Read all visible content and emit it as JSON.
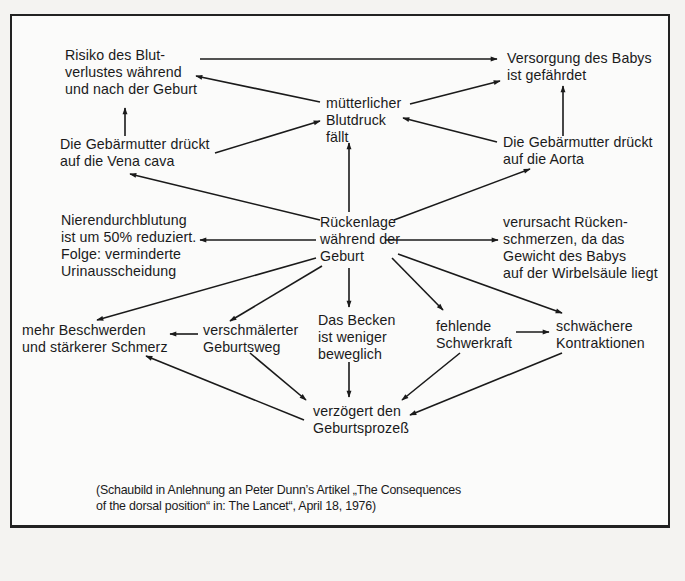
{
  "diagram": {
    "language": "de",
    "nodes": {
      "blutverlust": "Risiko des Blut-\nverlustes während\nund nach der Geburt",
      "versorgung": "Versorgung des Babys\nist gefährdet",
      "blutdruck": "mütterlicher\nBlutdruck\nfällt",
      "vena_cava": "Die Gebärmutter drückt\nauf die Vena cava",
      "aorta": "Die Gebärmutter drückt\nauf die Aorta",
      "niere": "Nierendurchblutung\nist um 50% reduziert.\nFolge: verminderte\nUrinausscheidung",
      "rueckenlage": "Rückenlage\nwährend der\nGeburt",
      "rueckenschmerz": "verursacht Rücken-\nschmerzen, da das\nGewicht des Babys\nauf der Wirbelsäule liegt",
      "beschwerden": "mehr Beschwerden\nund stärkerer Schmerz",
      "geburtsweg": "verschmälerter\nGeburtsweg",
      "becken": "Das Becken\nist weniger\nbeweglich",
      "schwerkraft": "fehlende\nSchwerkraft",
      "kontraktionen": "schwächere\nKontraktionen",
      "verzoegert": "verzögert den\nGeburtsprozeß"
    },
    "edges": [
      {
        "from": "blutverlust",
        "to": "versorgung"
      },
      {
        "from": "blutdruck",
        "to": "blutverlust"
      },
      {
        "from": "blutdruck",
        "to": "versorgung"
      },
      {
        "from": "vena_cava",
        "to": "blutverlust"
      },
      {
        "from": "vena_cava",
        "to": "blutdruck"
      },
      {
        "from": "aorta",
        "to": "blutdruck"
      },
      {
        "from": "aorta",
        "to": "versorgung"
      },
      {
        "from": "rueckenlage",
        "to": "blutdruck"
      },
      {
        "from": "rueckenlage",
        "to": "vena_cava"
      },
      {
        "from": "rueckenlage",
        "to": "aorta"
      },
      {
        "from": "rueckenlage",
        "to": "niere"
      },
      {
        "from": "rueckenlage",
        "to": "rueckenschmerz"
      },
      {
        "from": "rueckenlage",
        "to": "beschwerden"
      },
      {
        "from": "rueckenlage",
        "to": "geburtsweg"
      },
      {
        "from": "rueckenlage",
        "to": "becken"
      },
      {
        "from": "rueckenlage",
        "to": "schwerkraft"
      },
      {
        "from": "rueckenlage",
        "to": "kontraktionen"
      },
      {
        "from": "geburtsweg",
        "to": "beschwerden"
      },
      {
        "from": "schwerkraft",
        "to": "kontraktionen"
      },
      {
        "from": "geburtsweg",
        "to": "verzoegert"
      },
      {
        "from": "becken",
        "to": "verzoegert"
      },
      {
        "from": "schwerkraft",
        "to": "verzoegert"
      },
      {
        "from": "kontraktionen",
        "to": "verzoegert"
      },
      {
        "from": "verzoegert",
        "to": "beschwerden"
      }
    ],
    "caption": "(Schaubild in Anlehnung an Peter Dunn’s Artikel „The Consequences\nof the dorsal position“ in: The Lancet“, April 18, 1976)"
  },
  "colors": {
    "ink": "#1a1a1a",
    "paper": "#fbfbfa",
    "background": "#f4f3f1"
  }
}
